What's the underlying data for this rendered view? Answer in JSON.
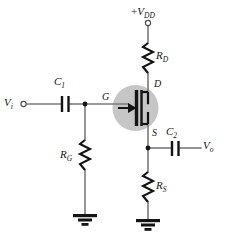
{
  "figure": {
    "background_color": "#ffffff",
    "wire_color": "#7a7a7a",
    "device_color": "#141414",
    "highlight_circle_color": "#c6c6c6"
  },
  "labels": {
    "supply": {
      "prefix": "+",
      "symbol": "V",
      "subscript": "DD",
      "text": "+VDD"
    },
    "input": {
      "symbol": "V",
      "subscript": "i",
      "text": "Vi"
    },
    "output": {
      "symbol": "V",
      "subscript": "o",
      "text": "Vo"
    },
    "coupling_cap_in": {
      "symbol": "C",
      "subscript": "1",
      "text": "C1"
    },
    "coupling_cap_out": {
      "symbol": "C",
      "subscript": "2",
      "text": "C2"
    },
    "drain_resistor": {
      "symbol": "R",
      "subscript": "D",
      "text": "RD"
    },
    "gate_resistor": {
      "symbol": "R",
      "subscript": "G",
      "text": "RG"
    },
    "source_resistor": {
      "symbol": "R",
      "subscript": "S",
      "text": "RS"
    },
    "terminal_gate": {
      "text": "G"
    },
    "terminal_drain": {
      "text": "D"
    },
    "terminal_source": {
      "text": "S"
    }
  },
  "components": [
    {
      "name": "supply-terminal",
      "type": "open-terminal",
      "label": "+VDD"
    },
    {
      "name": "drain-resistor",
      "type": "resistor",
      "label": "RD",
      "orientation": "vertical"
    },
    {
      "name": "jfet",
      "type": "n-channel-jfet",
      "terminals": [
        "G",
        "D",
        "S"
      ]
    },
    {
      "name": "input-terminal",
      "type": "open-terminal",
      "label": "Vi"
    },
    {
      "name": "input-coupling-capacitor",
      "type": "capacitor",
      "label": "C1",
      "orientation": "horizontal"
    },
    {
      "name": "gate-resistor",
      "type": "resistor",
      "label": "RG",
      "orientation": "vertical"
    },
    {
      "name": "gate-ground",
      "type": "ground"
    },
    {
      "name": "output-coupling-capacitor",
      "type": "capacitor",
      "label": "C2",
      "orientation": "horizontal"
    },
    {
      "name": "output-terminal",
      "type": "wire-end",
      "label": "Vo"
    },
    {
      "name": "source-resistor",
      "type": "resistor",
      "label": "RS",
      "orientation": "vertical"
    },
    {
      "name": "source-ground",
      "type": "ground"
    },
    {
      "name": "gate-node-junction",
      "type": "junction-dot"
    },
    {
      "name": "source-node-junction",
      "type": "junction-dot"
    }
  ]
}
